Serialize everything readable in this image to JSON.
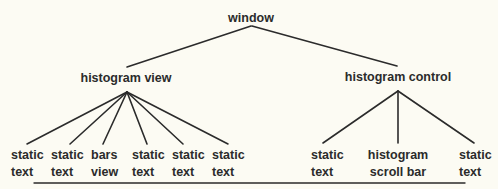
{
  "diagram": {
    "type": "tree",
    "root": {
      "label": "window",
      "children": [
        {
          "label": "histogram view",
          "children": [
            {
              "line1": "static",
              "line2": "text"
            },
            {
              "line1": "static",
              "line2": "text"
            },
            {
              "line1": "bars",
              "line2": "view"
            },
            {
              "line1": "static",
              "line2": "text"
            },
            {
              "line1": "static",
              "line2": "text"
            },
            {
              "line1": "static",
              "line2": "text"
            }
          ]
        },
        {
          "label": "histogram control",
          "children": [
            {
              "line1": "static",
              "line2": "text"
            },
            {
              "line1": "histogram",
              "line2": "scroll bar"
            },
            {
              "line1": "static",
              "line2": "text"
            }
          ]
        }
      ]
    },
    "colors": {
      "background": "#fcfbf3",
      "ink": "#2b2b2b"
    }
  }
}
